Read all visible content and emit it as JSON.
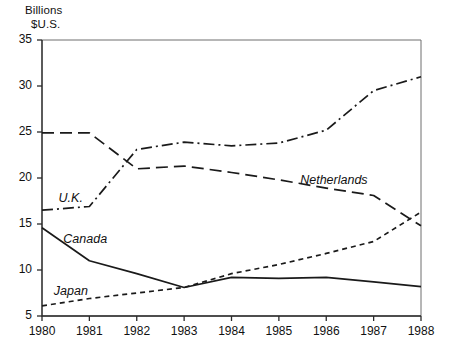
{
  "chart_data": {
    "type": "line",
    "title": "",
    "ylabel": "Billions\n$U.S.",
    "ylabel_line1": "Billions",
    "ylabel_line2": "$U.S.",
    "xlabel": "",
    "xlim": [
      1980,
      1988
    ],
    "ylim": [
      5,
      35
    ],
    "yticks": [
      5,
      10,
      15,
      20,
      25,
      30,
      35
    ],
    "ytick_labels": [
      "5",
      "10",
      "15",
      "20",
      "25",
      "30",
      "35"
    ],
    "xticks": [
      1980,
      1981,
      1982,
      1983,
      1984,
      1985,
      1986,
      1987,
      1988
    ],
    "xtick_labels": [
      "1980",
      "1981",
      "1982",
      "1983",
      "1984",
      "1985",
      "1986",
      "1987",
      "1988"
    ],
    "grid": false,
    "legend_position": "inline-annotations",
    "x": [
      1980,
      1981,
      1982,
      1983,
      1984,
      1985,
      1986,
      1987,
      1988
    ],
    "series": [
      {
        "name": "U.K.",
        "label": "U.K.",
        "style": "dash-dot",
        "color": "#1a1a1a",
        "values": [
          16.5,
          16.9,
          23.1,
          23.9,
          23.5,
          23.8,
          25.2,
          29.5,
          31.0
        ]
      },
      {
        "name": "Netherlands",
        "label": "Netherlands",
        "style": "long-dash",
        "color": "#1a1a1a",
        "values": [
          24.9,
          24.9,
          21.0,
          21.3,
          20.6,
          19.8,
          18.9,
          18.1,
          14.8
        ]
      },
      {
        "name": "Canada",
        "label": "Canada",
        "style": "solid",
        "color": "#1a1a1a",
        "values": [
          14.6,
          11.0,
          9.6,
          8.1,
          9.2,
          9.1,
          9.2,
          8.7,
          8.2
        ]
      },
      {
        "name": "Japan",
        "label": "Japan",
        "style": "short-dash",
        "color": "#1a1a1a",
        "values": [
          6.1,
          6.9,
          7.5,
          8.1,
          9.6,
          10.6,
          11.8,
          13.1,
          16.3
        ]
      }
    ],
    "annotations": [
      {
        "text": "U.K.",
        "x": 1980.35,
        "y": 17.6
      },
      {
        "text": "Canada",
        "x": 1980.45,
        "y": 13.2
      },
      {
        "text": "Japan",
        "x": 1980.25,
        "y": 7.5
      },
      {
        "text": "Netherlands",
        "x": 1985.45,
        "y": 19.6
      }
    ]
  }
}
